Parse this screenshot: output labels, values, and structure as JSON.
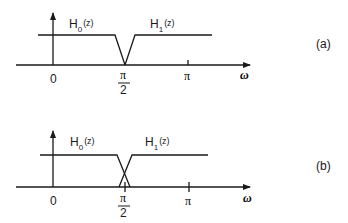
{
  "diagrams": [
    {
      "id": "a",
      "caption": "(a)",
      "filter0": {
        "name": "H",
        "sub": "0",
        "arg": "(z)"
      },
      "filter1": {
        "name": "H",
        "sub": "1",
        "arg": "(z)"
      },
      "ticks": {
        "zero": "0",
        "half_pi_num": "π",
        "half_pi_den": "2",
        "pi": "π"
      },
      "axis_label": "ω",
      "transition": "non-overlapping (meet at π/2)"
    },
    {
      "id": "b",
      "caption": "(b)",
      "filter0": {
        "name": "H",
        "sub": "0",
        "arg": "(z)"
      },
      "filter1": {
        "name": "H",
        "sub": "1",
        "arg": "(z)"
      },
      "ticks": {
        "zero": "0",
        "half_pi_num": "π",
        "half_pi_den": "2",
        "pi": "π"
      },
      "axis_label": "ω",
      "transition": "overlapping (cross at π/2)"
    }
  ],
  "colors": {
    "line": "#1a1a1a",
    "background": "#ffffff"
  }
}
